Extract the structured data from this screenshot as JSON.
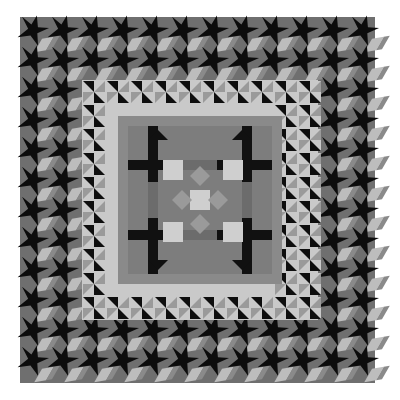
{
  "image": {
    "subject": "patchwork quilt photograph",
    "palette": {
      "background": "#ffffff",
      "outer_border_base": "#6f6f6f",
      "star_black": "#0c0c0c",
      "zigzag_light": "#bdbdbd",
      "zigzag_mid": "#8a8a8a",
      "inner_ring_light": "#c9c9c9",
      "inner_ring_mid": "#9a9a9a",
      "center_mid": "#7d7d7d",
      "center_light": "#cfcfcf",
      "center_dark": "#111111"
    },
    "layout": {
      "quilt_bounds": [
        20,
        17,
        375,
        383
      ],
      "outer_border_width": 60,
      "inner_ring_bounds": [
        82,
        80,
        318,
        320
      ],
      "center_bounds": [
        128,
        126,
        272,
        274
      ]
    }
  }
}
